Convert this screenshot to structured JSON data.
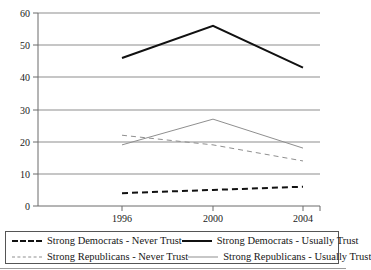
{
  "chart_data": {
    "type": "line",
    "title": "",
    "xlabel": "",
    "ylabel": "",
    "categories": [
      "1996",
      "2000",
      "2004"
    ],
    "x_tick_labels": [
      "1996",
      "2000",
      "2004"
    ],
    "y_tick_labels": [
      "0",
      "10",
      "20",
      "30",
      "40",
      "50",
      "60"
    ],
    "y_ticks": [
      0,
      10,
      20,
      30,
      40,
      50,
      60
    ],
    "ylim": [
      0,
      60
    ],
    "grid": "horizontal",
    "legend_position": "bottom",
    "series": [
      {
        "name": "Strong Democrats - Never Trust",
        "values": [
          4,
          5,
          6
        ],
        "style": "dashed",
        "color": "#111111",
        "width": 2
      },
      {
        "name": "Strong Democrats - Usually Trust",
        "values": [
          46,
          56,
          43
        ],
        "style": "solid",
        "color": "#111111",
        "width": 2
      },
      {
        "name": "Strong Republicans - Never Trust",
        "values": [
          22,
          19,
          14
        ],
        "style": "dashed",
        "color": "#8f8f8f",
        "width": 1
      },
      {
        "name": "Strong Republicans - Usually Trust",
        "values": [
          19,
          27,
          18
        ],
        "style": "solid",
        "color": "#8f8f8f",
        "width": 1
      }
    ]
  },
  "axis": {
    "y_labels": {
      "t60": "60",
      "t50": "50",
      "t40": "40",
      "t30": "30",
      "t20": "20",
      "t10": "10",
      "t0": "0"
    },
    "x_labels": {
      "x1996": "1996",
      "x2000": "2000",
      "x2004": "2004"
    }
  },
  "legend": {
    "items": [
      {
        "label": "Strong Democrats - Never Trust"
      },
      {
        "label": "Strong Democrats - Usually Trust"
      },
      {
        "label": "Strong Republicans - Never Trust"
      },
      {
        "label": "Strong Republicans - Usually Trust"
      }
    ]
  },
  "title_sliver": {
    "text": ""
  }
}
